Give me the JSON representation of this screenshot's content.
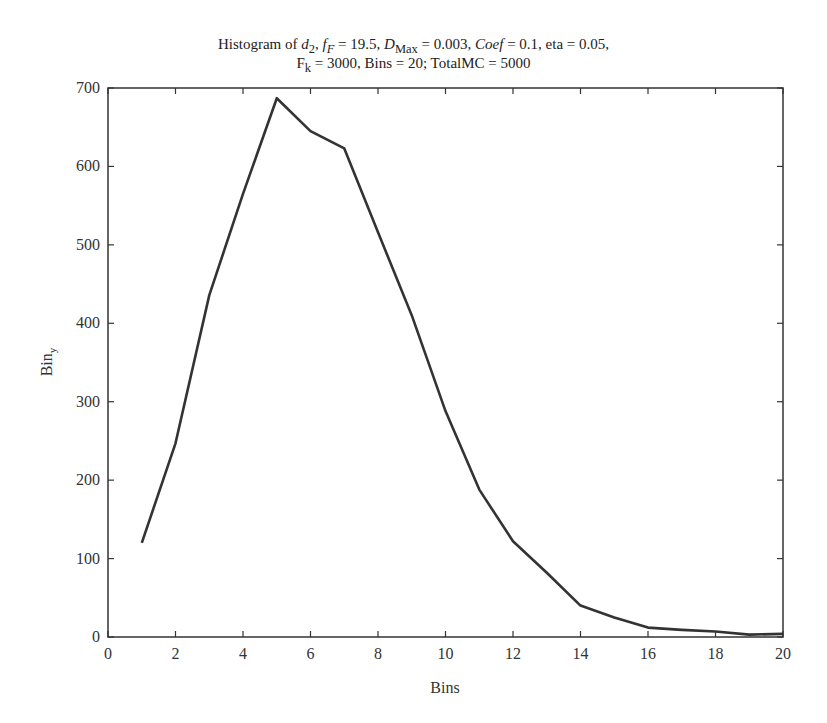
{
  "chart_data": {
    "type": "line",
    "title_parts": {
      "line1": {
        "prefix": "Histogram of ",
        "d_sym": "d",
        "d_sub": "2",
        "sep1": ", ",
        "f_sym": "f",
        "f_sub": "F",
        "f_val": " = 19.5,  ",
        "D_sym": "D",
        "D_sub": "Max",
        "D_val": " = 0.003, ",
        "coef_sym": "Coef",
        "coef_val": " = 0.1, eta = 0.05,"
      },
      "line2": {
        "F_sym": "F",
        "F_sub": "k",
        "rest": " = 3000, Bins = 20; TotalMC = 5000"
      }
    },
    "xlabel": "Bins",
    "ylabel": "Bin",
    "ylabel_sub": "y",
    "xlim": [
      0,
      20
    ],
    "ylim": [
      0,
      700
    ],
    "xticks": [
      "0",
      "2",
      "4",
      "6",
      "8",
      "10",
      "12",
      "14",
      "16",
      "18",
      "20"
    ],
    "yticks": [
      "0",
      "100",
      "200",
      "300",
      "400",
      "500",
      "600",
      "700"
    ],
    "grid": false,
    "legend": null,
    "x": [
      1,
      2,
      3,
      4,
      5,
      6,
      7,
      8,
      9,
      10,
      11,
      12,
      13,
      14,
      15,
      16,
      17,
      18,
      19,
      20
    ],
    "series": [
      {
        "name": "Bin_y",
        "color": "#333333",
        "values": [
          120,
          247,
          436,
          565,
          687,
          645,
          623,
          516,
          410,
          288,
          188,
          122,
          82,
          40,
          25,
          12,
          9,
          7,
          3,
          4
        ]
      }
    ]
  }
}
